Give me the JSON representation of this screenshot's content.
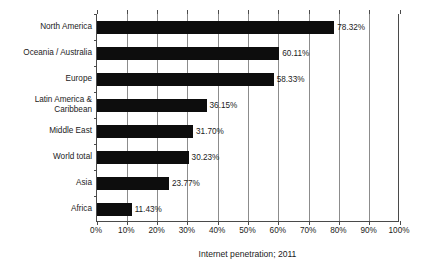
{
  "chart_data": {
    "type": "bar",
    "orientation": "horizontal",
    "title": "",
    "xlabel": "Internet penetration; 2011",
    "ylabel": "",
    "xlim": [
      0,
      100
    ],
    "grid": true,
    "legend": false,
    "categories": [
      "North America",
      "Oceania / Australia",
      "Europe",
      "Latin America &\nCaribbean",
      "Middle East",
      "World total",
      "Asia",
      "Africa"
    ],
    "values": [
      78.32,
      60.11,
      58.33,
      36.15,
      31.7,
      30.23,
      23.77,
      11.43
    ],
    "value_labels": [
      "78.32%",
      "60.11%",
      "58.33%",
      "36.15%",
      "31.70%",
      "30.23%",
      "23.77%",
      "11.43%"
    ],
    "xticks": [
      0,
      10,
      20,
      30,
      40,
      50,
      60,
      70,
      80,
      90,
      100
    ],
    "xtick_labels": [
      "0%",
      "10%",
      "20%",
      "30%",
      "40%",
      "50%",
      "60%",
      "70%",
      "80%",
      "90%",
      "100%"
    ],
    "bar_color": "#0d0d0d",
    "grid_color": "#8c8c8c",
    "axis_color": "#4a4a4a",
    "background_color": "#ffffff"
  }
}
